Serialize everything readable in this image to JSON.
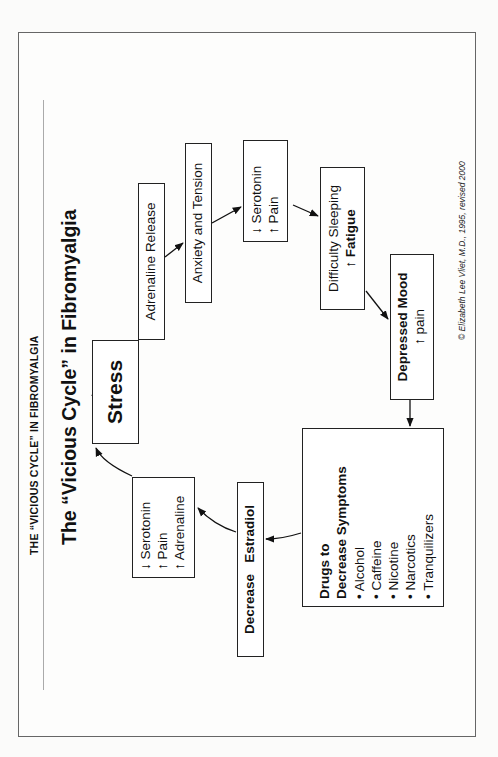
{
  "header": {
    "label": "THE “VICIOUS CYCLE” IN FIBROMYALGIA"
  },
  "title": "The “Vicious Cycle” in Fibromyalgia",
  "nodes": {
    "stress": {
      "label": "Stress"
    },
    "adrenaline_release": {
      "label": "Adrenaline Release"
    },
    "anxiety": {
      "label": "Anxiety and Tension"
    },
    "serotonin_pain": {
      "line1": "↓ Serotonin",
      "line2": "↑ Pain"
    },
    "difficulty_sleeping": {
      "line1": "Difficulty Sleeping",
      "line2_arrow": "↑",
      "line2": "Fatigue"
    },
    "depressed_mood": {
      "line1": "Depressed Mood",
      "line2": "↑ pain"
    },
    "drugs": {
      "title1": "Drugs to",
      "title2": "Decrease Symptoms",
      "items": [
        "• Alcohol",
        "• Caffeine",
        "• Nicotine",
        "• Narcotics",
        "• Tranquilizers"
      ]
    },
    "decrease_estradiol": {
      "label": "Decrease   Estradiol"
    },
    "serotonin_pain_adrenaline": {
      "line1": "↓ Serotonin",
      "line2": "↑ Pain",
      "line3": "↑ Adrenaline"
    }
  },
  "edges": [
    [
      "stress",
      "adrenaline_release"
    ],
    [
      "adrenaline_release",
      "anxiety"
    ],
    [
      "anxiety",
      "serotonin_pain"
    ],
    [
      "serotonin_pain",
      "difficulty_sleeping"
    ],
    [
      "difficulty_sleeping",
      "depressed_mood"
    ],
    [
      "depressed_mood",
      "drugs"
    ],
    [
      "drugs",
      "decrease_estradiol"
    ],
    [
      "decrease_estradiol",
      "serotonin_pain_adrenaline"
    ],
    [
      "serotonin_pain_adrenaline",
      "stress"
    ]
  ],
  "copyright": "© Elizabeth Lee Vliet, M.D., 1995, revised 2000"
}
